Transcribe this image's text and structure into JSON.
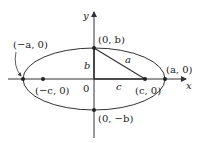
{
  "diagram": {
    "type": "ellipse-with-foci",
    "axes": {
      "x_label": "x",
      "y_label": "y"
    },
    "labels": {
      "left_vertex": "(−a, 0)",
      "right_vertex": "(a, 0)",
      "top_vertex": "(0, b)",
      "bottom_vertex": "(0, −b)",
      "left_focus": "(−c, 0)",
      "right_focus": "(c, 0)",
      "origin": "0",
      "segment_b": "b",
      "segment_c": "c",
      "segment_a": "a"
    },
    "colors": {
      "stroke": "#333333",
      "background": "#ffffff"
    }
  }
}
